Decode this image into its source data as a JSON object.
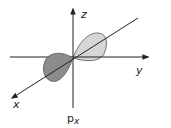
{
  "diagram": {
    "caption": {
      "main": "p",
      "subscript": "x"
    },
    "axes": {
      "x": {
        "label": "x"
      },
      "y": {
        "label": "y"
      },
      "z": {
        "label": "z"
      }
    },
    "lobes": [
      {
        "name": "positive-lobe",
        "direction": "+x (back, upper-right)",
        "color": "#d6d6d6"
      },
      {
        "name": "negative-lobe",
        "direction": "-x (front, lower-left)",
        "color": "#8c8c8c"
      }
    ],
    "colors": {
      "axis": "#222222",
      "lobe_outline": "#555555",
      "light_lobe": "#d6d6d6",
      "dark_lobe": "#8c8c8c"
    }
  }
}
